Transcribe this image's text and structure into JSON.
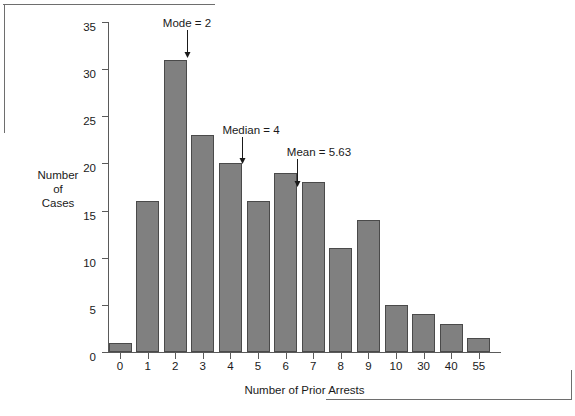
{
  "chart_data": {
    "type": "bar",
    "title": "",
    "xlabel": "Number of Prior Arrests",
    "ylabel": "Number of Cases",
    "ylabel_lines": [
      "Number",
      "of",
      "Cases"
    ],
    "categories": [
      "0",
      "1",
      "2",
      "3",
      "4",
      "5",
      "6",
      "7",
      "8",
      "9",
      "10",
      "30",
      "40",
      "55"
    ],
    "values": [
      1,
      16,
      31,
      23,
      20,
      16,
      19,
      18,
      11,
      14,
      5,
      4,
      3,
      1.5
    ],
    "ylim": [
      0,
      35
    ],
    "yticks": [
      0,
      5,
      10,
      15,
      20,
      25,
      30,
      35
    ],
    "ytick_labels": [
      "0",
      "5",
      "10",
      "15",
      "20",
      "25",
      "30",
      "35"
    ],
    "grid": false,
    "legend": "none",
    "bar_color": "#808080",
    "bar_edge_color": "#4a4a4a",
    "axis_color": "#5a5a5a",
    "text_color": "#1a1a1a",
    "annotations": [
      {
        "label": "Mode = 2",
        "category": "2",
        "value": 2
      },
      {
        "label": "Median = 4",
        "category": "4",
        "value": 4
      },
      {
        "label": "Mean = 5.63",
        "category": "5.63",
        "value": 5.63
      }
    ]
  }
}
